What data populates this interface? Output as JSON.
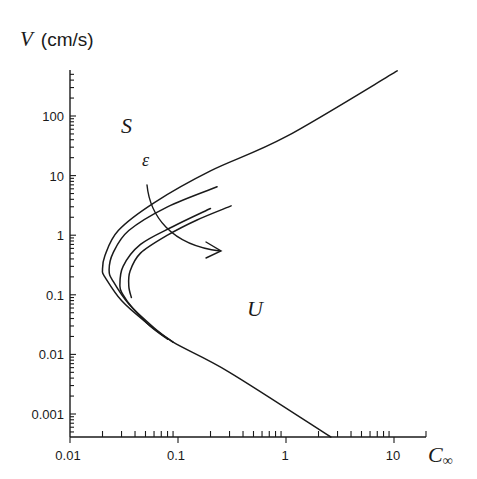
{
  "chart_data": {
    "type": "line",
    "title": "",
    "xlabel": "C∞",
    "ylabel": "V (cm/s)",
    "xscale": "log",
    "yscale": "log",
    "xlim": [
      0.01,
      20
    ],
    "ylim": [
      0.0004,
      800
    ],
    "x_ticks": [
      "0.01",
      "0.1",
      "1",
      "10"
    ],
    "y_ticks": [
      "0.001",
      "0.01",
      "0.1",
      "1",
      "10",
      "100"
    ],
    "grid": false,
    "legend": null,
    "annotations": [
      {
        "text": "S",
        "meaning": "stable region",
        "x": 0.038,
        "y": 100
      },
      {
        "text": "U",
        "meaning": "unstable region",
        "x": 0.7,
        "y": 0.08
      },
      {
        "text": "ε",
        "meaning": "parameter increasing along arrow",
        "x": 0.05,
        "y": 25
      }
    ],
    "arrow": {
      "from": [
        0.045,
        9
      ],
      "to": [
        0.32,
        0.7
      ],
      "label": "ε"
    },
    "series": [
      {
        "name": "curve-1",
        "points": [
          [
            2.6,
            0.0004
          ],
          [
            0.3,
            0.005
          ],
          [
            0.09,
            0.016
          ],
          [
            0.05,
            0.035
          ],
          [
            0.03,
            0.08
          ],
          [
            0.021,
            0.2
          ],
          [
            0.02,
            0.26
          ],
          [
            0.021,
            0.45
          ],
          [
            0.028,
            1.2
          ],
          [
            0.06,
            3.5
          ],
          [
            0.2,
            12
          ],
          [
            1,
            45
          ],
          [
            10.7,
            570
          ]
        ]
      },
      {
        "name": "curve-2",
        "points": [
          [
            0.09,
            0.016
          ],
          [
            0.06,
            0.028
          ],
          [
            0.035,
            0.07
          ],
          [
            0.025,
            0.17
          ],
          [
            0.023,
            0.26
          ],
          [
            0.025,
            0.5
          ],
          [
            0.035,
            1.2
          ],
          [
            0.08,
            3.0
          ],
          [
            0.23,
            6.5
          ]
        ]
      },
      {
        "name": "curve-3",
        "points": [
          [
            0.08,
            0.018
          ],
          [
            0.055,
            0.03
          ],
          [
            0.038,
            0.06
          ],
          [
            0.031,
            0.1
          ],
          [
            0.029,
            0.14
          ],
          [
            0.031,
            0.3
          ],
          [
            0.045,
            0.7
          ],
          [
            0.09,
            1.4
          ],
          [
            0.2,
            2.8
          ]
        ]
      },
      {
        "name": "curve-4",
        "points": [
          [
            0.037,
            0.09
          ],
          [
            0.035,
            0.14
          ],
          [
            0.036,
            0.25
          ],
          [
            0.045,
            0.5
          ],
          [
            0.08,
            1.0
          ],
          [
            0.15,
            1.8
          ],
          [
            0.31,
            3.1
          ]
        ]
      }
    ]
  },
  "labels": {
    "y_axis": "V (cm/s)",
    "x_axis_main": "C",
    "x_axis_sub": "∞",
    "region_stable": "S",
    "region_unstable": "U",
    "param": "ε",
    "xticks": [
      "0.01",
      "0.1",
      "1",
      "10"
    ],
    "yticks": [
      "100",
      "10",
      "1",
      "0.1",
      "0.01",
      "0.001"
    ]
  }
}
